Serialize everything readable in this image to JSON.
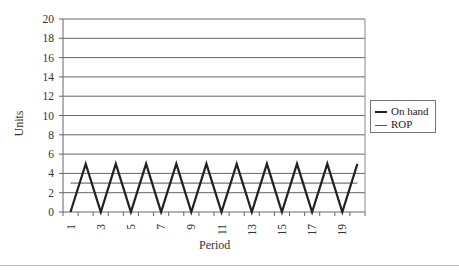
{
  "chart_data": {
    "type": "line",
    "title": "",
    "xlabel": "Period",
    "ylabel": "Units",
    "categories": [
      1,
      2,
      3,
      4,
      5,
      6,
      7,
      8,
      9,
      10,
      11,
      12,
      13,
      14,
      15,
      16,
      17,
      18,
      19,
      20
    ],
    "x_tick_labels": [
      "1",
      "3",
      "5",
      "7",
      "9",
      "11",
      "13",
      "15",
      "17",
      "19"
    ],
    "y_ticks": [
      0,
      2,
      4,
      6,
      8,
      10,
      12,
      14,
      16,
      18,
      20
    ],
    "ylim": [
      0,
      20
    ],
    "grid": true,
    "legend_position": "right",
    "series": [
      {
        "name": "On hand",
        "values": [
          0,
          5,
          0,
          5,
          0,
          5,
          0,
          5,
          0,
          5,
          0,
          5,
          0,
          5,
          0,
          5,
          0,
          5,
          0,
          5
        ],
        "color": "#222222",
        "width": 2.2
      },
      {
        "name": "ROP",
        "values": [
          3,
          3,
          3,
          3,
          3,
          3,
          3,
          3,
          3,
          3,
          3,
          3,
          3,
          3,
          3,
          3,
          3,
          3,
          3,
          3
        ],
        "color": "#555555",
        "width": 1
      }
    ]
  },
  "legend": {
    "items": [
      "On hand",
      "ROP"
    ]
  },
  "axes": {
    "x_title": "Period",
    "y_title": "Units"
  }
}
